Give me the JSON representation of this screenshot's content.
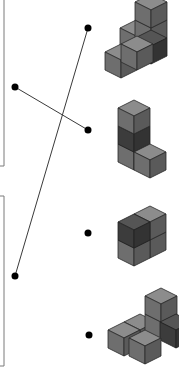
{
  "diagram": {
    "type": "matching-exercise",
    "colors": {
      "line": "#3a3a3a",
      "dot": "#000000",
      "box_border": "#7a7a7a",
      "cube_top": "#8c8c8c",
      "cube_left": "#6e6e6e",
      "cube_right": "#5a5a5a",
      "cube_dark_top": "#555555",
      "cube_dark_left": "#3c3c3c",
      "cube_dark_right": "#333333",
      "cube_edge": "#2a2a2a"
    },
    "left_boxes": [
      {
        "id": "box-1",
        "label": "",
        "y_top": -2,
        "y_bottom": 166
      },
      {
        "id": "box-2",
        "label": "",
        "y_top": 196,
        "y_bottom": 366
      }
    ],
    "left_dots": [
      {
        "id": "left-dot-1",
        "x": 15,
        "y": 87
      },
      {
        "id": "left-dot-2",
        "x": 15,
        "y": 276
      }
    ],
    "right_dots": [
      {
        "id": "right-dot-1",
        "x": 88,
        "y": 28
      },
      {
        "id": "right-dot-2",
        "x": 88,
        "y": 130
      },
      {
        "id": "right-dot-3",
        "x": 88,
        "y": 233
      },
      {
        "id": "right-dot-4",
        "x": 89,
        "y": 335
      }
    ],
    "connections": [
      {
        "from": "left-dot-1",
        "to": "right-dot-2"
      },
      {
        "from": "left-dot-2",
        "to": "right-dot-1"
      }
    ],
    "figures": [
      {
        "id": "figure-1",
        "description": "stepped block figure, 5 visible cubes with one dark cube"
      },
      {
        "id": "figure-2",
        "description": "L-shaped tower of 4 cubes with dark middle cube"
      },
      {
        "id": "figure-3",
        "description": "2x2 block of cubes with dark front-top cube"
      },
      {
        "id": "figure-4",
        "description": "low stepped figure of 4 visible cubes"
      }
    ]
  }
}
